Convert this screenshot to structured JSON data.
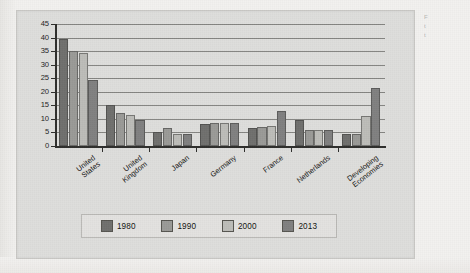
{
  "chart_data": {
    "type": "bar",
    "title": "",
    "subtitle": "",
    "xlabel": "",
    "ylabel": "",
    "ylim": [
      0,
      45
    ],
    "ytick_step": 5,
    "yticks": [
      "0",
      "5",
      "10",
      "15",
      "20",
      "25",
      "30",
      "35",
      "40",
      "45"
    ],
    "grid": true,
    "grid_axis": "y",
    "legend_position": "bottom",
    "categories": [
      "United States",
      "United Kingdom",
      "Japan",
      "Germany",
      "France",
      "Netherlands",
      "Developing Economies"
    ],
    "category_lines": [
      [
        "United",
        "States"
      ],
      [
        "United",
        "Kingdom"
      ],
      [
        "Japan"
      ],
      [
        "Germany"
      ],
      [
        "France"
      ],
      [
        "Netherlands"
      ],
      [
        "Developing",
        "Economies"
      ]
    ],
    "series": [
      {
        "name": "1980",
        "color": "#6f6f6d",
        "values": [
          39.5,
          15.2,
          5.0,
          8.0,
          6.5,
          9.5,
          4.5
        ]
      },
      {
        "name": "1990",
        "color": "#9a9a97",
        "values": [
          35.2,
          12.0,
          6.5,
          8.5,
          7.0,
          6.0,
          4.5
        ]
      },
      {
        "name": "2000",
        "color": "#bcbcb8",
        "values": [
          34.3,
          11.5,
          4.5,
          8.5,
          7.5,
          6.0,
          11.0
        ]
      },
      {
        "name": "2013",
        "color": "#808080",
        "values": [
          24.2,
          9.5,
          4.5,
          8.5,
          13.0,
          6.0,
          21.5
        ]
      }
    ]
  },
  "legend": {
    "items": [
      {
        "label": "1980",
        "color": "#6f6f6d"
      },
      {
        "label": "1990",
        "color": "#9a9a97"
      },
      {
        "label": "2000",
        "color": "#bcbcb8"
      },
      {
        "label": "2013",
        "color": "#808080"
      }
    ]
  },
  "margin_note": {
    "line1": "F",
    "line2": "t",
    "line3": "t"
  }
}
